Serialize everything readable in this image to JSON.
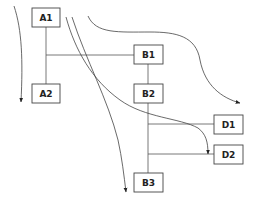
{
  "diagram": {
    "colors": {
      "line": "#555555",
      "box_stroke": "#444444",
      "text": "#222222",
      "background": "#ffffff"
    },
    "nodes": [
      {
        "id": "A1",
        "label": "A1",
        "x": 32,
        "y": 8,
        "w": 28,
        "h": 19
      },
      {
        "id": "A2",
        "label": "A2",
        "x": 32,
        "y": 84,
        "w": 28,
        "h": 19
      },
      {
        "id": "B1",
        "label": "B1",
        "x": 134,
        "y": 45,
        "w": 29,
        "h": 19
      },
      {
        "id": "B2",
        "label": "B2",
        "x": 134,
        "y": 84,
        "w": 29,
        "h": 19
      },
      {
        "id": "D1",
        "label": "D1",
        "x": 214,
        "y": 115,
        "w": 29,
        "h": 19
      },
      {
        "id": "D2",
        "label": "D2",
        "x": 214,
        "y": 145,
        "w": 29,
        "h": 19
      },
      {
        "id": "B3",
        "label": "B3",
        "x": 134,
        "y": 173,
        "w": 29,
        "h": 19
      }
    ],
    "connectors": [
      {
        "from": "A1",
        "to": "A2"
      },
      {
        "from": "A1-trunk",
        "to": "B1"
      },
      {
        "from": "B1",
        "to": "B2"
      },
      {
        "from": "B2",
        "to": "B3"
      },
      {
        "from": "B2-trunk",
        "to": "D1"
      },
      {
        "from": "B2-trunk",
        "to": "D2"
      }
    ],
    "flow_arrows": [
      {
        "name": "left-down-flow",
        "path": "M14,6 C22,30 23,60 21,102"
      },
      {
        "name": "top-right-flow",
        "path": "M88,16 C96,34 118,32 150,32 C176,32 196,36 200,60 C205,86 222,98 240,103"
      },
      {
        "name": "center-to-d2-flow",
        "path": "M66,17 C75,50 92,80 120,100 C145,118 180,118 198,128 C206,134 208,142 208,154"
      },
      {
        "name": "center-to-b3-flow",
        "path": "M72,17 C86,60 108,100 118,140 C122,158 124,176 126,192"
      }
    ]
  }
}
